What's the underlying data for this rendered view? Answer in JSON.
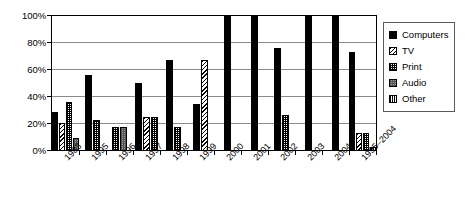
{
  "chart_data": {
    "type": "bar",
    "title": "",
    "xlabel": "",
    "ylabel": "",
    "ylim": [
      0,
      100
    ],
    "yticks": [
      "0%",
      "20%",
      "40%",
      "60%",
      "80%",
      "100%"
    ],
    "ytick_values": [
      0,
      20,
      40,
      60,
      80,
      100
    ],
    "grid": true,
    "legend_position": "right",
    "categories": [
      "1983",
      "1995",
      "1996",
      "1997",
      "1998",
      "1999",
      "2000",
      "2001",
      "2002",
      "2003",
      "2004",
      "1995–2004"
    ],
    "series": [
      {
        "name": "Computers",
        "pattern": "solid-black",
        "color": "#000000",
        "values": [
          28,
          56,
          0,
          50,
          67,
          34,
          100,
          100,
          76,
          100,
          100,
          73
        ]
      },
      {
        "name": "TV",
        "pattern": "diagonal-hatch",
        "color": "#ffffff",
        "values": [
          20,
          0,
          0,
          25,
          0,
          67,
          0,
          0,
          0,
          0,
          0,
          13
        ]
      },
      {
        "name": "Print",
        "pattern": "cross-dot",
        "color": "#ffffff",
        "values": [
          36,
          22.5,
          17,
          25,
          17,
          0,
          0,
          0,
          26,
          0,
          0,
          13
        ]
      },
      {
        "name": "Audio",
        "pattern": "gray-dot",
        "color": "#9a9a9a",
        "values": [
          9,
          0,
          17,
          0,
          0,
          0,
          0,
          0,
          0,
          0,
          0,
          0
        ]
      },
      {
        "name": "Other",
        "pattern": "vertical-lines",
        "color": "#ffffff",
        "values": [
          0,
          0,
          0,
          0,
          0,
          0,
          0,
          0,
          0,
          0,
          0,
          2
        ]
      }
    ]
  }
}
